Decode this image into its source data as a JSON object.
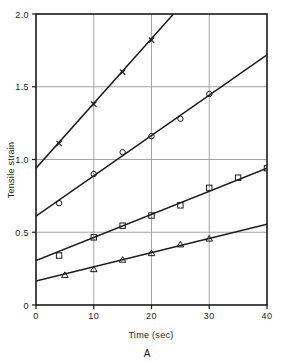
{
  "chart_data": {
    "type": "line",
    "title": "",
    "subtitle": "",
    "panel_label": "A",
    "xlabel": "Time (sec)",
    "ylabel": "Tensile strain",
    "xlim": [
      0,
      40
    ],
    "ylim": [
      0,
      2.0
    ],
    "xticks": [
      0,
      10,
      20,
      30,
      40
    ],
    "xtick_labels": [
      "0",
      "10",
      "20",
      "30",
      "40"
    ],
    "yticks": [
      0,
      0.5,
      1.0,
      1.5,
      2.0
    ],
    "ytick_labels": [
      "0",
      "0.5",
      "1.0",
      "1.5",
      "2.0"
    ],
    "grid": true,
    "grid_axes": "both",
    "legend": "none",
    "legend_position": "none",
    "series": [
      {
        "name": "series-x",
        "marker": "x",
        "intercept": 0.94,
        "slope": 0.0445,
        "line_x": [
          0,
          23.8
        ],
        "line_y": [
          0.94,
          2.0
        ],
        "x": [
          4,
          10,
          15,
          20
        ],
        "values": [
          1.11,
          1.38,
          1.6,
          1.82
        ]
      },
      {
        "name": "series-circle",
        "marker": "circle",
        "intercept": 0.61,
        "slope": 0.0278,
        "line_x": [
          0,
          40
        ],
        "line_y": [
          0.61,
          1.72
        ],
        "x": [
          4,
          10,
          15,
          20,
          25,
          30
        ],
        "values": [
          0.7,
          0.9,
          1.05,
          1.16,
          1.28,
          1.45
        ]
      },
      {
        "name": "series-square",
        "marker": "square",
        "intercept": 0.305,
        "slope": 0.0159,
        "line_x": [
          0,
          40
        ],
        "line_y": [
          0.305,
          0.94
        ],
        "x": [
          4,
          10,
          15,
          20,
          25,
          30,
          35,
          40
        ],
        "values": [
          0.34,
          0.465,
          0.545,
          0.615,
          0.685,
          0.805,
          0.875,
          0.94
        ]
      },
      {
        "name": "series-triangle",
        "marker": "triangle",
        "intercept": 0.165,
        "slope": 0.0098,
        "line_x": [
          0,
          40
        ],
        "line_y": [
          0.165,
          0.555
        ],
        "x": [
          5,
          10,
          15,
          20,
          25,
          30
        ],
        "values": [
          0.205,
          0.245,
          0.31,
          0.355,
          0.415,
          0.455
        ]
      }
    ],
    "colors": {
      "line": "#1a1a1a",
      "grid": "#9a9a9a",
      "axis": "#1a1a1a",
      "background": "#ffffff"
    }
  }
}
